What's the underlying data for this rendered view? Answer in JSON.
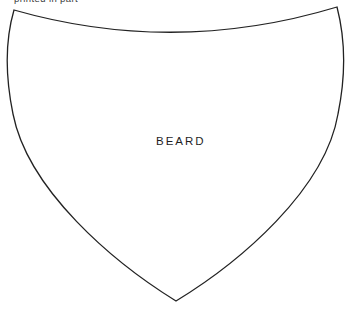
{
  "canvas": {
    "width": "346",
    "height": "312",
    "background": "#ffffff"
  },
  "caption": {
    "fragment": "printed in part",
    "color": "#3c3c3c"
  },
  "figure": {
    "label": "BEARD",
    "label_color": "#1f1f1f",
    "outline_color": "#222222",
    "stroke_width": "1.3",
    "path": "M 14 10 Q 175 56 337 7 C 344 34 347 70 338 114 C 325 190 240 262 176 301 C 113 262 28 190 13 114 C 4 70 7 34 14 10 Z",
    "label_x": "156",
    "label_y": "145"
  }
}
